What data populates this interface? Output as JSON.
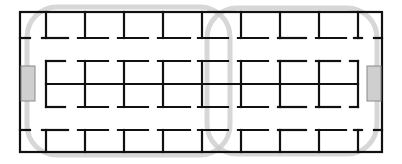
{
  "diagram": {
    "type": "floor-plan",
    "colors": {
      "wall": "#111111",
      "loop_path": "#c9c9c9",
      "dock_fill": "#cfcfcf",
      "dock_stroke": "#8a8a8a",
      "background": "#ffffff"
    },
    "frame": {
      "x1": 20,
      "y1": 12,
      "x2": 382,
      "y2": 152
    },
    "columns_x": [
      46,
      85,
      124,
      163,
      202,
      241,
      280,
      319,
      358
    ],
    "top_row": {
      "y_top": 12,
      "y_corridor": 38
    },
    "middle_block": {
      "y_top": 61,
      "y_center": 84,
      "y_bottom": 107
    },
    "bottom_row": {
      "y_corridor": 130,
      "y_bottom": 152
    },
    "docks": [
      {
        "name": "left-dock",
        "x": 21,
        "y": 66,
        "w": 14,
        "h": 35
      },
      {
        "name": "right-dock",
        "x": 367,
        "y": 66,
        "w": 14,
        "h": 35
      }
    ],
    "loops": [
      {
        "name": "left-loop",
        "x": 27,
        "y": 7,
        "w": 203,
        "h": 148,
        "r": 30
      },
      {
        "name": "right-loop",
        "x": 207,
        "y": 8,
        "w": 170,
        "h": 146,
        "r": 30
      }
    ]
  }
}
